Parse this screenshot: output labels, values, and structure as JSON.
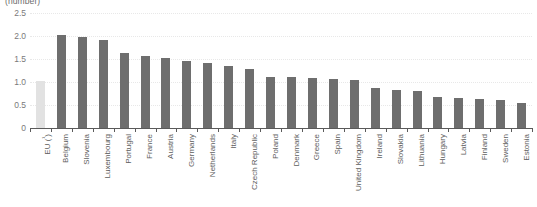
{
  "chart_data": {
    "type": "bar",
    "title": "(number)",
    "xlabel": "",
    "ylabel": "",
    "ylim": [
      0,
      2.5
    ],
    "ytick_labels": [
      "0",
      "0.5",
      "1.0",
      "1.5",
      "2.0",
      "2.5"
    ],
    "ytick_values": [
      0,
      0.5,
      1.0,
      1.5,
      2.0,
      2.5
    ],
    "grid": true,
    "legend": "none",
    "categories": [
      "EU (¹)",
      "Belgium",
      "Slovenia",
      "Luxembourg",
      "Portugal",
      "France",
      "Austria",
      "Germany",
      "Netherlands",
      "Italy",
      "Czech Republic",
      "Poland",
      "Denmark",
      "Greece",
      "Spain",
      "United Kingdom",
      "Ireland",
      "Slovakia",
      "Lithuania",
      "Hungary",
      "Latvia",
      "Finland",
      "Sweden",
      "Estonia"
    ],
    "values": [
      1.02,
      2.03,
      1.97,
      1.92,
      1.62,
      1.56,
      1.53,
      1.45,
      1.41,
      1.35,
      1.29,
      1.11,
      1.1,
      1.09,
      1.07,
      1.05,
      0.86,
      0.83,
      0.81,
      0.68,
      0.65,
      0.62,
      0.6,
      0.54
    ],
    "highlight_index": 0,
    "colors": {
      "bar": "#6e6e6e",
      "bar_highlight": "#e2e2e2",
      "axis": "#5a5a5a",
      "gridline": "#e8e8e8",
      "text": "#5d5d5d"
    }
  }
}
